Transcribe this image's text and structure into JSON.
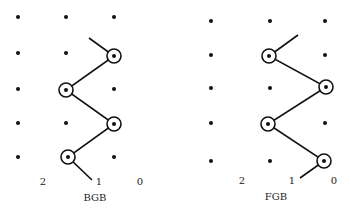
{
  "panels": [
    {
      "name": "BGB",
      "title": "BGB",
      "column_labels": [
        {
          "text": "2",
          "x": 43,
          "y": 181
        },
        {
          "text": "1",
          "x": 99,
          "y": 181
        },
        {
          "text": "0",
          "x": 140,
          "y": 181
        }
      ],
      "title_pos": {
        "x": 95,
        "y": 197
      },
      "columns_x": [
        18,
        66,
        114
      ],
      "rows_y": [
        17,
        53,
        89,
        123,
        157
      ],
      "circled": [
        [
          114,
          56
        ],
        [
          66,
          90
        ],
        [
          114,
          124
        ],
        [
          68,
          157
        ]
      ],
      "path": [
        [
          89,
          38
        ],
        [
          114,
          56
        ],
        [
          66,
          90
        ],
        [
          114,
          124
        ],
        [
          68,
          157
        ],
        [
          92,
          180
        ]
      ]
    },
    {
      "name": "FGB",
      "title": "FGB",
      "column_labels": [
        {
          "text": "2",
          "x": 242,
          "y": 180
        },
        {
          "text": "1",
          "x": 292,
          "y": 180
        },
        {
          "text": "0",
          "x": 334,
          "y": 180
        }
      ],
      "title_pos": {
        "x": 276,
        "y": 196
      },
      "columns_x": [
        211,
        270,
        325
      ],
      "rows_y": [
        21,
        55,
        88,
        123,
        161
      ],
      "circled": [
        [
          269,
          56
        ],
        [
          326,
          87
        ],
        [
          268,
          124
        ],
        [
          324,
          161
        ]
      ],
      "path": [
        [
          298,
          35
        ],
        [
          269,
          56
        ],
        [
          326,
          87
        ],
        [
          268,
          124
        ],
        [
          324,
          161
        ],
        [
          300,
          178
        ]
      ]
    }
  ],
  "colors": {
    "ink": "#111111",
    "background": "#ffffff"
  }
}
